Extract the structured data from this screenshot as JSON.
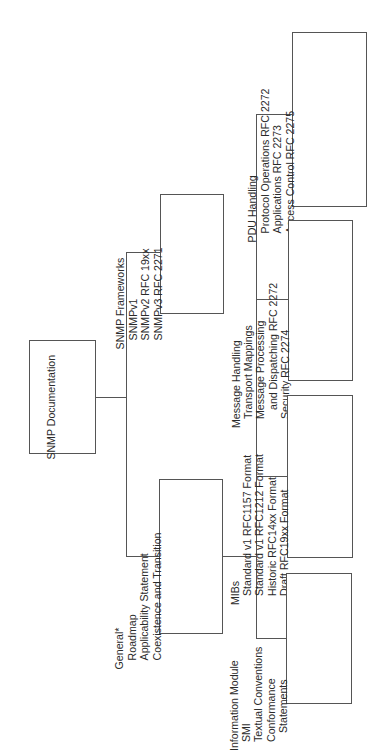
{
  "diagram": {
    "orientation": "rotated-90-ccw",
    "root": {
      "label": "SNMP Documentation"
    },
    "level1": [
      {
        "id": "frameworks",
        "lines": [
          "SNMP Frameworks",
          "SNMPv1",
          "SNMPv2 RFC 19xx",
          "SNMPv3 RFC 2271"
        ]
      },
      {
        "id": "general",
        "lines": [
          "General*",
          "Roadmap",
          "Applicability Statement",
          "Coexistence and Transition"
        ]
      }
    ],
    "level2": [
      {
        "id": "pdu",
        "lines": [
          "PDU Handling",
          "Protocol Operations RFC 2272",
          "Applications RFC 2273",
          "Access Control RFC 2275"
        ]
      },
      {
        "id": "message",
        "lines": [
          "Message Handling",
          "Transport Mappings",
          "Message Processing",
          "and Dispatching RFC 2272",
          "Security RFC 2274"
        ]
      },
      {
        "id": "mibs",
        "lines": [
          "MIBs",
          "Standard v1 RFC1157 Format",
          "Standard v1 RFC1212 Format",
          "Historic RFC14xx Format",
          "Draft RFC19xx Format"
        ]
      },
      {
        "id": "info",
        "lines": [
          "Information Module",
          "SMI",
          "Textual Conventions",
          "Conformance",
          "Statements"
        ]
      }
    ],
    "line_color": "#555555"
  }
}
